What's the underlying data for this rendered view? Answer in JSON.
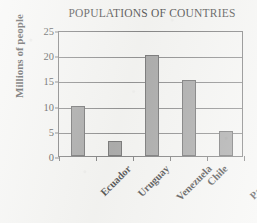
{
  "chart_data": {
    "type": "bar",
    "title": "POPULATIONS OF COUNTRIES",
    "xlabel": "",
    "ylabel": "Millions of people",
    "categories": [
      "Ecuador",
      "Uruguay",
      "Venezuela",
      "Chile",
      "Paraguay"
    ],
    "values": [
      10,
      3,
      20,
      15,
      5
    ],
    "ylim": [
      0,
      25
    ],
    "ytick_labels": [
      "0",
      "5",
      "10",
      "15",
      "20",
      "25"
    ],
    "ytick_values": [
      0,
      5,
      10,
      15,
      20,
      25
    ],
    "grid": "horizontal",
    "legend": "none",
    "bar_color": "#8e8e8e",
    "bar_edge_color": "#4a4a4b",
    "axis_color": "#59595a",
    "background_color": "#f3f3f1",
    "text_color": "#141414"
  }
}
